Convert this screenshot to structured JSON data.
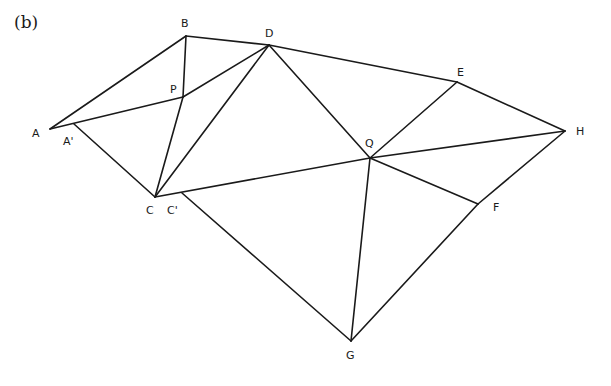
{
  "panel_label": "(b)",
  "points": {
    "A": {
      "x": 50,
      "y": 129,
      "label": "A",
      "lx": 32,
      "ly": 137
    },
    "A1": {
      "x": 74,
      "y": 124,
      "label": "A'",
      "lx": 63,
      "ly": 145
    },
    "B": {
      "x": 186,
      "y": 36,
      "label": "B",
      "lx": 181,
      "ly": 27
    },
    "D": {
      "x": 269,
      "y": 45,
      "label": "D",
      "lx": 265,
      "ly": 37
    },
    "P": {
      "x": 183,
      "y": 97,
      "label": "P",
      "lx": 170,
      "ly": 93
    },
    "C": {
      "x": 155,
      "y": 197,
      "label": "C",
      "lx": 146,
      "ly": 214
    },
    "C1": {
      "x": 182,
      "y": 193,
      "label": "C'",
      "lx": 167,
      "ly": 214
    },
    "E": {
      "x": 457,
      "y": 82,
      "label": "E",
      "lx": 457,
      "ly": 76
    },
    "H": {
      "x": 565,
      "y": 131,
      "label": "H",
      "lx": 576,
      "ly": 135
    },
    "Q": {
      "x": 370,
      "y": 158,
      "label": "Q",
      "lx": 365,
      "ly": 147
    },
    "F": {
      "x": 478,
      "y": 204,
      "label": "F",
      "lx": 493,
      "ly": 211
    },
    "G": {
      "x": 351,
      "y": 341,
      "label": "G",
      "lx": 346,
      "ly": 359
    }
  },
  "edges": [
    [
      "A",
      "B"
    ],
    [
      "B",
      "D"
    ],
    [
      "D",
      "E"
    ],
    [
      "E",
      "H"
    ],
    [
      "A",
      "P"
    ],
    [
      "P",
      "D"
    ],
    [
      "B",
      "P"
    ],
    [
      "P",
      "C"
    ],
    [
      "D",
      "C"
    ],
    [
      "D",
      "Q"
    ],
    [
      "A1",
      "C"
    ],
    [
      "C",
      "Q"
    ],
    [
      "Q",
      "H"
    ],
    [
      "Q",
      "E"
    ],
    [
      "Q",
      "F"
    ],
    [
      "H",
      "F"
    ],
    [
      "F",
      "G"
    ],
    [
      "Q",
      "G"
    ],
    [
      "C1",
      "G"
    ]
  ]
}
